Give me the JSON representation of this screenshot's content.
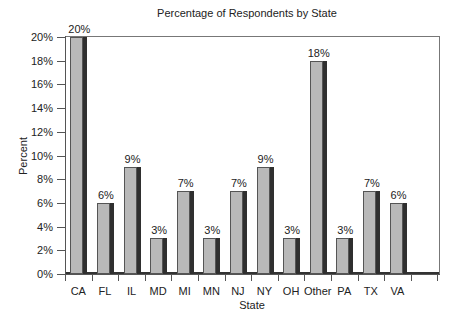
{
  "chart_data": {
    "type": "bar",
    "title": "Percentage of Respondents by State",
    "xlabel": "State",
    "ylabel": "Percent",
    "categories": [
      "CA",
      "FL",
      "IL",
      "MD",
      "MI",
      "MN",
      "NJ",
      "NY",
      "OH",
      "Other",
      "PA",
      "TX",
      "VA"
    ],
    "values": [
      20,
      6,
      9,
      3,
      7,
      3,
      7,
      9,
      3,
      18,
      3,
      7,
      6
    ],
    "value_labels": [
      "20%",
      "6%",
      "9%",
      "3%",
      "7%",
      "3%",
      "7%",
      "9%",
      "3%",
      "18%",
      "3%",
      "7%",
      "6%"
    ],
    "ylim": [
      0,
      20
    ],
    "yticks": [
      "0%",
      "2%",
      "4%",
      "6%",
      "8%",
      "10%",
      "12%",
      "14%",
      "16%",
      "18%",
      "20%"
    ],
    "grid": false,
    "legend": null,
    "style": "3d-bar",
    "colors": {
      "bar_front": "#b9b9b9",
      "bar_side": "#2f2f2f",
      "axis": "#555555"
    }
  }
}
